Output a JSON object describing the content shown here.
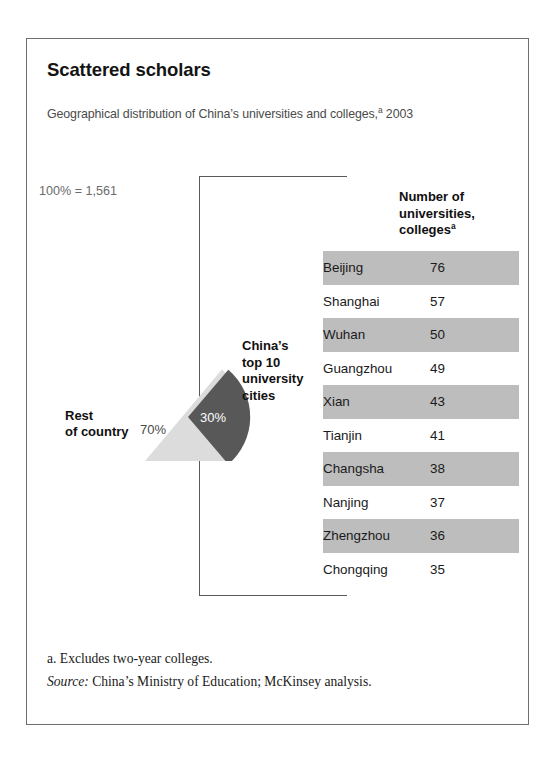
{
  "exhibit": {
    "title": "Scattered scholars",
    "subtitle_text": "Geographical distribution of China’s universities and colleges,",
    "subtitle_footnote_marker": "a",
    "subtitle_year": " 2003"
  },
  "pie_labels": {
    "total": "100% = 1,561",
    "rest_line1": "Rest",
    "rest_line2": "of country",
    "top10_line1": "China’s",
    "top10_line2": "top 10",
    "top10_line3": "university",
    "top10_line4": "cities",
    "slice_rest_pct": "70%",
    "slice_top10_pct": "30%"
  },
  "table": {
    "header_line1": "Number of",
    "header_line2": "universities,",
    "header_line3": "colleges",
    "header_footnote_marker": "a",
    "rows": [
      {
        "city": "Beijing",
        "value": "76"
      },
      {
        "city": "Shanghai",
        "value": "57"
      },
      {
        "city": "Wuhan",
        "value": "50"
      },
      {
        "city": "Guangzhou",
        "value": "49"
      },
      {
        "city": "Xian",
        "value": "43"
      },
      {
        "city": "Tianjin",
        "value": "41"
      },
      {
        "city": "Changsha",
        "value": "38"
      },
      {
        "city": "Nanjing",
        "value": "37"
      },
      {
        "city": "Zhengzhou",
        "value": "36"
      },
      {
        "city": "Chongqing",
        "value": "35"
      }
    ]
  },
  "footnotes": {
    "note_a": "a.  Excludes two-year colleges.",
    "source_prefix": "Source:",
    "source_text": " China’s Ministry of Education; McKinsey analysis."
  },
  "colors": {
    "slice_rest": "#dcdcdc",
    "slice_top10": "#585858",
    "band": "#bdbdbd",
    "border": "#6e6e6e",
    "text": "#1a1a1a",
    "muted_text": "#6a6a6a"
  },
  "chart_data": {
    "type": "pie",
    "title": "Scattered scholars",
    "subtitle": "Geographical distribution of China’s universities and colleges,a 2003",
    "total": 1561,
    "total_label": "100% = 1,561",
    "categories": [
      "Rest of country",
      "China’s top 10 university cities"
    ],
    "values": [
      70,
      30
    ],
    "value_unit": "percent",
    "data_labels": [
      "70%",
      "30%"
    ],
    "slice_colors": [
      "#dcdcdc",
      "#585858"
    ],
    "exploded_slice": "China’s top 10 university cities",
    "legend": "inline-labels",
    "grid": false,
    "companion_table": {
      "type": "table",
      "title": "Number of universities, collegesa",
      "columns": [
        "City",
        "Number of universities, colleges"
      ],
      "categories": [
        "Beijing",
        "Shanghai",
        "Wuhan",
        "Guangzhou",
        "Xian",
        "Tianjin",
        "Changsha",
        "Nanjing",
        "Zhengzhou",
        "Chongqing"
      ],
      "values": [
        76,
        57,
        50,
        49,
        43,
        41,
        38,
        37,
        36,
        35
      ]
    },
    "annotations": [
      "a. Excludes two-year colleges.",
      "Source: China’s Ministry of Education; McKinsey analysis."
    ]
  }
}
